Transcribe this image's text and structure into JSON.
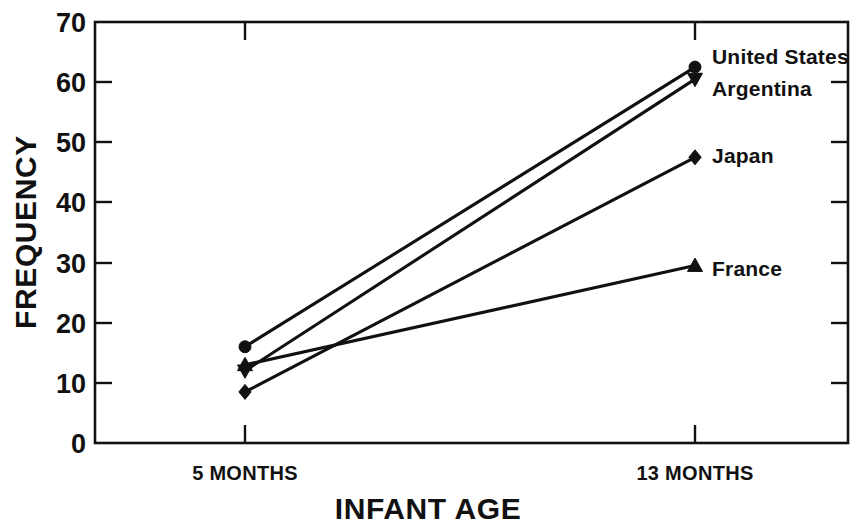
{
  "chart_data": {
    "type": "line",
    "title": "",
    "xlabel": "INFANT AGE",
    "ylabel": "FREQUENCY",
    "categories": [
      "5 MONTHS",
      "13 MONTHS"
    ],
    "x": [
      5,
      13
    ],
    "ylim": [
      0,
      70
    ],
    "yticks": [
      0,
      10,
      20,
      30,
      40,
      50,
      60,
      70
    ],
    "ytick_labels": [
      "0",
      "10",
      "20",
      "30",
      "40",
      "50",
      "60",
      "70"
    ],
    "grid": false,
    "legend_position": "right-inline-at-line-end",
    "line_color": "#111111",
    "series": [
      {
        "name": "United States",
        "marker": "circle",
        "values": [
          16,
          62.5
        ]
      },
      {
        "name": "Argentina",
        "marker": "triangle-down",
        "values": [
          12,
          60.5
        ]
      },
      {
        "name": "Japan",
        "marker": "diamond",
        "values": [
          8.5,
          47.5
        ]
      },
      {
        "name": "France",
        "marker": "triangle-up",
        "values": [
          13,
          29.5
        ]
      }
    ]
  },
  "axes": {
    "y_label": "FREQUENCY",
    "x_label": "INFANT AGE",
    "y_ticks": [
      "70",
      "60",
      "50",
      "40",
      "30",
      "20",
      "10",
      "0"
    ],
    "x_ticks": [
      "5 MONTHS",
      "13 MONTHS"
    ]
  },
  "series_labels": {
    "united_states": "United States",
    "argentina": "Argentina",
    "japan": "Japan",
    "france": "France"
  }
}
